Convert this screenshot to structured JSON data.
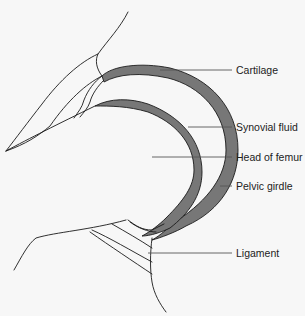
{
  "diagram": {
    "colors": {
      "cartilage_fill": "#777777",
      "outline": "#1a1a1a",
      "leader": "#555555",
      "background": "#f7f7f7"
    },
    "labels": [
      {
        "id": "cartilage",
        "text": "Cartilage"
      },
      {
        "id": "synovial-fluid",
        "text": "Synovial fluid"
      },
      {
        "id": "head-of-femur",
        "text": "Head of femur"
      },
      {
        "id": "pelvic-girdle",
        "text": "Pelvic girdle"
      },
      {
        "id": "ligament",
        "text": "Ligament"
      }
    ]
  }
}
